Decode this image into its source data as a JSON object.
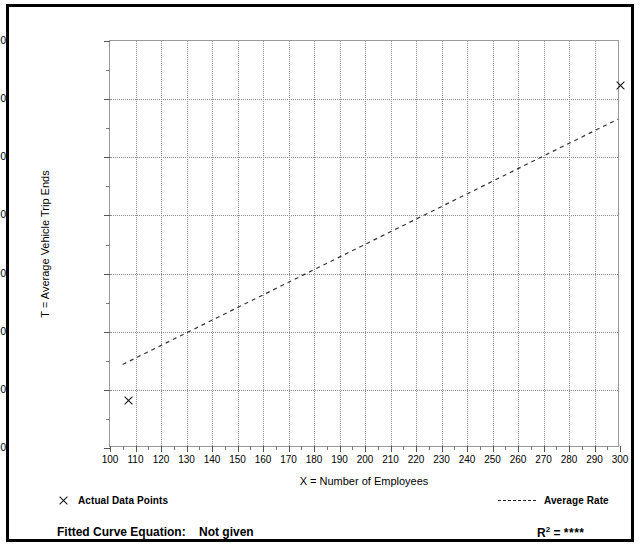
{
  "chart_data": {
    "type": "scatter",
    "title": "",
    "xlabel": "X = Number of Employees",
    "ylabel": "T = Average Vehicle Trip Ends",
    "xlim": [
      100,
      300
    ],
    "ylim": [
      1000,
      8000
    ],
    "x_major_step": 10,
    "y_major_step": 1000,
    "y_minor_step": 500,
    "grid": true,
    "grid_style": "dotted",
    "x_ticks": [
      100,
      110,
      120,
      130,
      140,
      150,
      160,
      170,
      180,
      190,
      200,
      210,
      220,
      230,
      240,
      250,
      260,
      270,
      280,
      290,
      300
    ],
    "x_tick_labels": [
      "100",
      "110",
      "120",
      "130",
      "140",
      "150",
      "160",
      "170",
      "180",
      "190",
      "200",
      "210",
      "220",
      "230",
      "240",
      "250",
      "260",
      "270",
      "280",
      "290",
      "300"
    ],
    "y_ticks": [
      1000,
      2000,
      3000,
      4000,
      5000,
      6000,
      7000,
      8000
    ],
    "y_tick_labels": [
      "1,000",
      "2,000",
      "3,000",
      "4,000",
      "5,000",
      "6,000",
      "7,000",
      "8,000"
    ],
    "series": [
      {
        "name": "Actual Data Points",
        "type": "scatter",
        "marker": "x",
        "points": [
          {
            "x": 107,
            "y": 1820
          },
          {
            "x": 300,
            "y": 7240
          }
        ]
      },
      {
        "name": "Average Rate",
        "type": "line",
        "style": "dashed",
        "points": [
          {
            "x": 105,
            "y": 2410
          },
          {
            "x": 300,
            "y": 6650
          }
        ]
      }
    ],
    "legend_position": "below-plot"
  },
  "axes": {
    "y_title": "T = Average Vehicle Trip Ends",
    "x_title": "X = Number of Employees"
  },
  "legend": {
    "actual_points_label": "Actual Data Points",
    "average_rate_label": "Average Rate"
  },
  "footer": {
    "equation_label": "Fitted Curve Equation:",
    "equation_value": "Not given",
    "r_squared_label": "R",
    "r_squared_exponent": "2",
    "r_squared_eq": "=",
    "r_squared_value": "****"
  },
  "colors": {
    "frame": "#000000",
    "plot_border": "#9a9a9a",
    "gridline": "#8d8d8d",
    "marker": "#111111",
    "trendline": "#333333",
    "text": "#000000"
  }
}
